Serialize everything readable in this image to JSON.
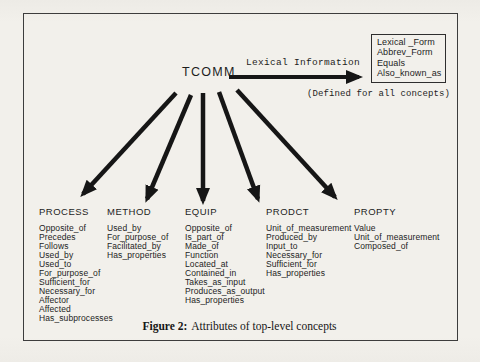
{
  "figure": {
    "root_label": "TCOMM",
    "lexical_arrow_label": "Lexical Information",
    "lexical_box_items": [
      "Lexical _Form",
      "Abbrev_Form",
      "Equals",
      "Also_known_as"
    ],
    "lexical_note": "(Defined for all concepts)",
    "concepts": [
      {
        "name": "PROCESS",
        "attributes": [
          "Opposite_of",
          "Precedes",
          "Follows",
          "Used_by",
          "Used_to",
          "For_purpose_of",
          "Sufficient_for",
          "Necessary_for",
          "Affector",
          "Affected",
          "Has_subprocesses"
        ]
      },
      {
        "name": "METHOD",
        "attributes": [
          "Used_by",
          "For_purpose_of",
          "Facilitated_by",
          "Has_properties"
        ]
      },
      {
        "name": "EQUIP",
        "attributes": [
          "Opposite_of",
          "Is_part_of",
          "Made_of",
          "Function",
          "Located_at",
          "Contained_in",
          "Takes_as_input",
          "Produces_as_output",
          "Has_properties"
        ]
      },
      {
        "name": "PRODCT",
        "attributes": [
          "Unit_of_measurement",
          "Produced_by",
          "Input_to",
          "Necessary_for",
          "Sufficient_for",
          "Has_properties"
        ]
      },
      {
        "name": "PROPTY",
        "attributes": [
          "Value",
          "Unit_of_measurement",
          "Composed_of"
        ]
      }
    ],
    "caption": {
      "label": "Figure 2:",
      "text": "Attributes of top-level concepts"
    },
    "ink_color": "#161616",
    "paper_color": "#f2f0eb"
  }
}
